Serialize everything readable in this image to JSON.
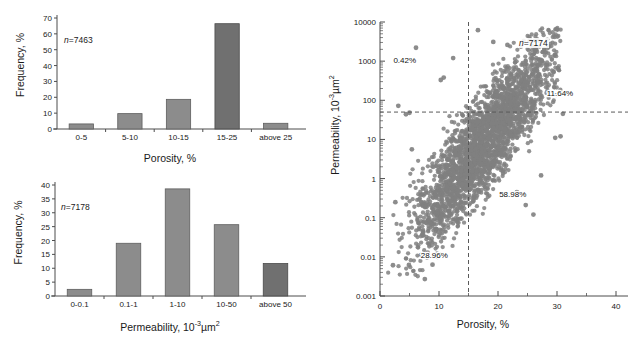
{
  "figure": {
    "background": "#ffffff",
    "marker_color": "#808080",
    "bar_color": "#8c8c8c",
    "bar_dark_color": "#707070",
    "axis_color": "#4d4d4d"
  },
  "chart_data": [
    {
      "id": "porosity-histogram",
      "type": "bar",
      "title": "",
      "xlabel": "Porosity, %",
      "ylabel": "Frequency, %",
      "categories": [
        "0-5",
        "5-10",
        "10-15",
        "15-25",
        "above 25"
      ],
      "values": [
        3.2,
        9.7,
        18.7,
        66.4,
        3.6
      ],
      "ylim": [
        0,
        70
      ],
      "yticks": [
        0,
        10,
        20,
        30,
        40,
        50,
        60,
        70
      ],
      "annotation": "n=7463",
      "annotation_n": "7463",
      "grid": false,
      "legend": "none"
    },
    {
      "id": "permeability-histogram",
      "type": "bar",
      "title": "",
      "xlabel": "Permeability, 10-3µm2",
      "xlabel_base": "Permeability, 10",
      "xlabel_exp": "-3",
      "xlabel_tail": "µm",
      "xlabel_exp2": "2",
      "ylabel": "Frequency, %",
      "categories": [
        "0-0.1",
        "0.1-1",
        "1-10",
        "10-50",
        "above 50"
      ],
      "values": [
        2.4,
        19.0,
        38.6,
        25.7,
        11.7
      ],
      "ylim": [
        0,
        40
      ],
      "yticks": [
        0,
        5,
        10,
        15,
        20,
        25,
        30,
        35,
        40
      ],
      "annotation": "n=7178",
      "annotation_n": "7178",
      "grid": false,
      "legend": "none"
    },
    {
      "id": "porosity-permeability-scatter",
      "type": "scatter",
      "title": "",
      "xlabel": "Porosity, %",
      "ylabel": "Permeability, 10-3µm2",
      "ylabel_base": "Permeability, 10",
      "ylabel_exp": "-3",
      "ylabel_tail": "µm",
      "ylabel_exp2": "2",
      "xlim": [
        0,
        40
      ],
      "xticks": [
        0,
        10,
        20,
        30,
        40
      ],
      "xminorticks": [
        5,
        15,
        25,
        35
      ],
      "ylim": [
        0.001,
        10000
      ],
      "yscale": "log",
      "yticks": [
        0.001,
        0.01,
        0.1,
        1,
        10,
        100,
        1000,
        10000
      ],
      "ytick_labels": [
        "0.001",
        "0.01",
        "0.1",
        "1",
        "10",
        "100",
        "1000",
        "10000"
      ],
      "annotation": "n=7174",
      "annotation_n": "7174",
      "reference_lines": {
        "vertical_x": 15,
        "horizontal_y": 50
      },
      "quadrant_labels": [
        {
          "name": "upper-left",
          "text": "0.42%",
          "x": 4.2,
          "y": 900
        },
        {
          "name": "upper-right",
          "text": "11.64%",
          "x": 30.5,
          "y": 130
        },
        {
          "name": "lower-right",
          "text": "58.98%",
          "x": 22.5,
          "y": 0.33
        },
        {
          "name": "lower-left",
          "text": "28.96%",
          "x": 9.2,
          "y": 0.0095
        }
      ],
      "marker_color": "#808080",
      "grid": false,
      "legend": "none",
      "n_points": 7174
    }
  ]
}
